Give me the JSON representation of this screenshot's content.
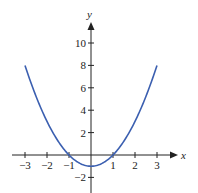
{
  "chart_data": {
    "type": "line",
    "title": "",
    "xlabel": "x",
    "ylabel": "y",
    "function": "y = x^2 - 1",
    "x": [
      -3,
      -2.5,
      -2,
      -1.5,
      -1,
      -0.5,
      0,
      0.5,
      1,
      1.5,
      2,
      2.5,
      3
    ],
    "series": [
      {
        "name": "y = x^2 - 1",
        "color": "#3b5fb0",
        "values": [
          8,
          5.25,
          3,
          1.25,
          0,
          -0.75,
          -1,
          -0.75,
          0,
          1.25,
          3,
          5.25,
          8
        ]
      }
    ],
    "xlim": [
      -3.5,
      3.8
    ],
    "ylim": [
      -3.4,
      12
    ],
    "x_ticks": [
      -3,
      -2,
      -1,
      1,
      2,
      3
    ],
    "x_tick_labels": [
      "−3",
      "−2",
      "−1",
      "1",
      "2",
      "3"
    ],
    "y_ticks": [
      10,
      8,
      6,
      4,
      2,
      -2
    ],
    "y_tick_labels": [
      "10",
      "8",
      "6",
      "4",
      "2",
      "−2"
    ],
    "grid": false,
    "legend": "none"
  }
}
